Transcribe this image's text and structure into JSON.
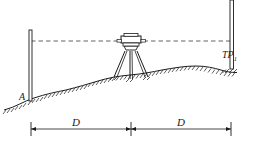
{
  "figure": {
    "background_color": "#ffffff",
    "line_color": "#1a1a1a",
    "sight_line_color": "#3a3a3a"
  },
  "labels": {
    "benchmark": "A",
    "turning_point": "TP",
    "turning_point_subscript": "1",
    "distance_left": "D",
    "distance_right": "D"
  },
  "elements": {
    "left_staff_name": "levelling-staff-at-A",
    "right_staff_name": "levelling-staff-at-TP1",
    "instrument_name": "level-instrument",
    "tripod_name": "tripod",
    "sight_line_name": "line-of-sight",
    "ground_name": "ground-profile",
    "dimension_line_name": "dimension-line"
  },
  "geometry": {
    "sight_line_y": 41,
    "left_staff_x": 30,
    "instrument_x": 131,
    "right_staff_x": 232,
    "dimension_line_y": 129,
    "ground_points": "wavy terrain rising from left to centre mound then falling to right"
  }
}
